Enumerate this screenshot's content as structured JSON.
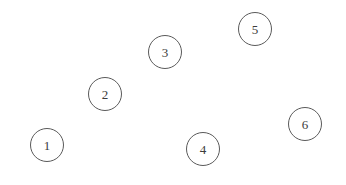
{
  "diagram": {
    "background_color": "#ffffff",
    "stroke_color": "#5a5a5a",
    "label_color": "#3c3c3c",
    "canvas": {
      "width": 346,
      "height": 185
    },
    "node_diameter": 34,
    "nodes": [
      {
        "id": "1",
        "label": "1",
        "cx": 47,
        "cy": 145,
        "d": 34
      },
      {
        "id": "2",
        "label": "2",
        "cx": 105,
        "cy": 94,
        "d": 34
      },
      {
        "id": "3",
        "label": "3",
        "cx": 165,
        "cy": 52,
        "d": 34
      },
      {
        "id": "4",
        "label": "4",
        "cx": 203,
        "cy": 149,
        "d": 34
      },
      {
        "id": "5",
        "label": "5",
        "cx": 255,
        "cy": 29,
        "d": 34
      },
      {
        "id": "6",
        "label": "6",
        "cx": 305,
        "cy": 124,
        "d": 34
      }
    ]
  }
}
